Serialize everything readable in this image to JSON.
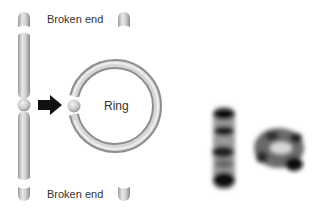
{
  "diagram": {
    "labels": {
      "top_broken_end": "Broken end",
      "bottom_broken_end": "Broken end",
      "ring": "Ring"
    },
    "colors": {
      "chromosome_fill": "#c4c4c4",
      "chromosome_highlight": "#e6e6e6",
      "chromosome_shadow": "#8e8e8e",
      "arrow": "#111111",
      "text": "#333333",
      "micrograph_dark": "#1a1a1a"
    },
    "elements": [
      "linear-chromosome",
      "top-left-broken-end",
      "top-right-broken-end",
      "bottom-left-broken-end",
      "bottom-right-broken-end",
      "transformation-arrow",
      "ring-chromosome",
      "micrograph-linear-chromosome",
      "micrograph-ring-chromosome"
    ]
  }
}
